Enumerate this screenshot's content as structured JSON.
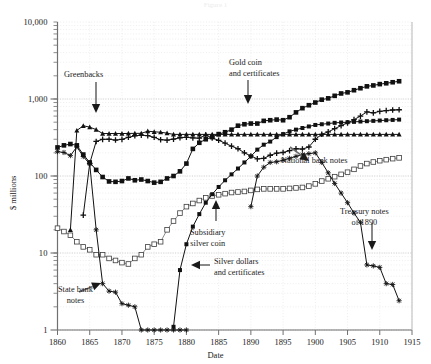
{
  "figure": {
    "faint_header": "Figure 1",
    "axis_title_y": "$ millions",
    "axis_title_x": "Date"
  },
  "annotations": [
    {
      "name": "greenbacks",
      "lines": [
        "Greenbacks"
      ]
    },
    {
      "name": "gold-coin",
      "lines": [
        "Gold coin",
        "and certificates"
      ]
    },
    {
      "name": "national-bank",
      "lines": [
        "National bank notes"
      ]
    },
    {
      "name": "subsidiary",
      "lines": [
        "Subsidiary",
        "silver coin"
      ]
    },
    {
      "name": "silver-dollars",
      "lines": [
        "Silver dollars",
        "and certificates"
      ]
    },
    {
      "name": "treasury-notes",
      "lines": [
        "Treasury notes",
        "of 1890"
      ]
    },
    {
      "name": "state-bank",
      "lines": [
        "State bank",
        "notes"
      ]
    }
  ],
  "chart_data": {
    "type": "line",
    "title": "",
    "xlabel": "Date",
    "ylabel": "$ millions",
    "xlim": [
      1860,
      1915
    ],
    "ylim": [
      1,
      10000
    ],
    "yscale": "log",
    "grid": true,
    "legend": "annotations-inline",
    "xticks": [
      1860,
      1865,
      1870,
      1875,
      1880,
      1885,
      1890,
      1895,
      1900,
      1905,
      1910,
      1915
    ],
    "yticks": [
      1,
      10,
      100,
      1000,
      10000
    ],
    "ytick_labels": [
      "1",
      "10",
      "100",
      "1,000",
      "10,000"
    ],
    "series": [
      {
        "name": "Greenbacks",
        "marker": "triangle-up",
        "color": "#111111",
        "points": [
          [
            1860,
            0
          ],
          [
            1862,
            20
          ],
          [
            1863,
            390
          ],
          [
            1864,
            449
          ],
          [
            1865,
            431
          ],
          [
            1866,
            400
          ],
          [
            1867,
            356
          ],
          [
            1868,
            356
          ],
          [
            1869,
            356
          ],
          [
            1870,
            356
          ],
          [
            1871,
            357
          ],
          [
            1872,
            358
          ],
          [
            1873,
            358
          ],
          [
            1874,
            382
          ],
          [
            1875,
            375
          ],
          [
            1876,
            370
          ],
          [
            1877,
            360
          ],
          [
            1878,
            347
          ],
          [
            1879,
            347
          ],
          [
            1880,
            347
          ],
          [
            1881,
            347
          ],
          [
            1882,
            347
          ],
          [
            1883,
            347
          ],
          [
            1884,
            347
          ],
          [
            1885,
            347
          ],
          [
            1886,
            347
          ],
          [
            1887,
            347
          ],
          [
            1888,
            347
          ],
          [
            1889,
            347
          ],
          [
            1890,
            347
          ],
          [
            1891,
            347
          ],
          [
            1892,
            347
          ],
          [
            1893,
            347
          ],
          [
            1894,
            347
          ],
          [
            1895,
            347
          ],
          [
            1896,
            347
          ],
          [
            1897,
            347
          ],
          [
            1898,
            347
          ],
          [
            1899,
            347
          ],
          [
            1900,
            347
          ],
          [
            1901,
            347
          ],
          [
            1902,
            347
          ],
          [
            1903,
            347
          ],
          [
            1904,
            347
          ],
          [
            1905,
            347
          ],
          [
            1906,
            347
          ],
          [
            1907,
            347
          ],
          [
            1908,
            347
          ],
          [
            1909,
            347
          ],
          [
            1910,
            347
          ],
          [
            1911,
            347
          ],
          [
            1912,
            347
          ],
          [
            1913,
            347
          ]
        ]
      },
      {
        "name": "Gold coin and certificates",
        "marker": "square-filled",
        "color": "#111111",
        "points": [
          [
            1860,
            235
          ],
          [
            1861,
            250
          ],
          [
            1862,
            260
          ],
          [
            1863,
            250
          ],
          [
            1864,
            190
          ],
          [
            1865,
            150
          ],
          [
            1866,
            120
          ],
          [
            1867,
            97
          ],
          [
            1868,
            85
          ],
          [
            1869,
            84
          ],
          [
            1870,
            86
          ],
          [
            1871,
            93
          ],
          [
            1872,
            88
          ],
          [
            1873,
            90
          ],
          [
            1874,
            86
          ],
          [
            1875,
            82
          ],
          [
            1876,
            84
          ],
          [
            1877,
            93
          ],
          [
            1878,
            100
          ],
          [
            1879,
            115
          ],
          [
            1880,
            145
          ],
          [
            1881,
            225
          ],
          [
            1882,
            270
          ],
          [
            1883,
            300
          ],
          [
            1884,
            320
          ],
          [
            1885,
            350
          ],
          [
            1886,
            370
          ],
          [
            1887,
            400
          ],
          [
            1888,
            450
          ],
          [
            1889,
            470
          ],
          [
            1890,
            480
          ],
          [
            1891,
            480
          ],
          [
            1892,
            520
          ],
          [
            1893,
            530
          ],
          [
            1894,
            540
          ],
          [
            1895,
            530
          ],
          [
            1896,
            580
          ],
          [
            1897,
            670
          ],
          [
            1898,
            760
          ],
          [
            1899,
            830
          ],
          [
            1900,
            900
          ],
          [
            1901,
            980
          ],
          [
            1902,
            1020
          ],
          [
            1903,
            1100
          ],
          [
            1904,
            1180
          ],
          [
            1905,
            1220
          ],
          [
            1906,
            1300
          ],
          [
            1907,
            1380
          ],
          [
            1908,
            1460
          ],
          [
            1909,
            1500
          ],
          [
            1910,
            1560
          ],
          [
            1911,
            1600
          ],
          [
            1912,
            1650
          ],
          [
            1913,
            1700
          ]
        ]
      },
      {
        "name": "National bank notes",
        "marker": "plus",
        "color": "#111111",
        "points": [
          [
            1863,
            0
          ],
          [
            1864,
            31
          ],
          [
            1865,
            146
          ],
          [
            1866,
            281
          ],
          [
            1867,
            299
          ],
          [
            1868,
            300
          ],
          [
            1869,
            293
          ],
          [
            1870,
            299
          ],
          [
            1871,
            318
          ],
          [
            1872,
            333
          ],
          [
            1873,
            339
          ],
          [
            1874,
            334
          ],
          [
            1875,
            318
          ],
          [
            1876,
            296
          ],
          [
            1877,
            292
          ],
          [
            1878,
            301
          ],
          [
            1879,
            314
          ],
          [
            1880,
            318
          ],
          [
            1881,
            312
          ],
          [
            1882,
            310
          ],
          [
            1883,
            340
          ],
          [
            1884,
            311
          ],
          [
            1885,
            291
          ],
          [
            1886,
            267
          ],
          [
            1887,
            244
          ],
          [
            1888,
            226
          ],
          [
            1889,
            200
          ],
          [
            1890,
            182
          ],
          [
            1891,
            167
          ],
          [
            1892,
            169
          ],
          [
            1893,
            186
          ],
          [
            1894,
            198
          ],
          [
            1895,
            202
          ],
          [
            1896,
            213
          ],
          [
            1897,
            226
          ],
          [
            1898,
            224
          ],
          [
            1899,
            238
          ],
          [
            1900,
            300
          ],
          [
            1901,
            348
          ],
          [
            1902,
            374
          ],
          [
            1903,
            412
          ],
          [
            1904,
            450
          ],
          [
            1905,
            490
          ],
          [
            1906,
            539
          ],
          [
            1907,
            600
          ],
          [
            1908,
            680
          ],
          [
            1909,
            660
          ],
          [
            1910,
            690
          ],
          [
            1911,
            708
          ],
          [
            1912,
            720
          ],
          [
            1913,
            725
          ]
        ]
      },
      {
        "name": "Subsidiary silver coin",
        "marker": "square-open",
        "color": "#4a4a4a",
        "points": [
          [
            1860,
            21
          ],
          [
            1861,
            19
          ],
          [
            1862,
            17
          ],
          [
            1863,
            14
          ],
          [
            1864,
            12
          ],
          [
            1865,
            11
          ],
          [
            1866,
            9.5
          ],
          [
            1867,
            9.5
          ],
          [
            1868,
            8.5
          ],
          [
            1869,
            8
          ],
          [
            1870,
            7.5
          ],
          [
            1871,
            7.2
          ],
          [
            1872,
            8.5
          ],
          [
            1873,
            9.5
          ],
          [
            1874,
            12
          ],
          [
            1875,
            13
          ],
          [
            1876,
            14
          ],
          [
            1877,
            20
          ],
          [
            1878,
            26
          ],
          [
            1879,
            33
          ],
          [
            1880,
            40
          ],
          [
            1881,
            44
          ],
          [
            1882,
            48
          ],
          [
            1883,
            52
          ],
          [
            1884,
            55
          ],
          [
            1885,
            57
          ],
          [
            1886,
            59
          ],
          [
            1887,
            61
          ],
          [
            1888,
            62
          ],
          [
            1889,
            63
          ],
          [
            1890,
            65
          ],
          [
            1891,
            67
          ],
          [
            1892,
            68
          ],
          [
            1893,
            68
          ],
          [
            1894,
            68
          ],
          [
            1895,
            68
          ],
          [
            1896,
            69
          ],
          [
            1897,
            70
          ],
          [
            1898,
            71
          ],
          [
            1899,
            74
          ],
          [
            1900,
            79
          ],
          [
            1901,
            86
          ],
          [
            1902,
            92
          ],
          [
            1903,
            98
          ],
          [
            1904,
            105
          ],
          [
            1905,
            112
          ],
          [
            1906,
            122
          ],
          [
            1907,
            135
          ],
          [
            1908,
            145
          ],
          [
            1909,
            152
          ],
          [
            1910,
            158
          ],
          [
            1911,
            163
          ],
          [
            1912,
            168
          ],
          [
            1913,
            172
          ]
        ]
      },
      {
        "name": "Silver dollars and certificates",
        "marker": "square-filled-small",
        "color": "#111111",
        "points": [
          [
            1878,
            1.1
          ],
          [
            1879,
            6
          ],
          [
            1880,
            13
          ],
          [
            1881,
            22
          ],
          [
            1882,
            32
          ],
          [
            1883,
            45
          ],
          [
            1884,
            58
          ],
          [
            1885,
            72
          ],
          [
            1886,
            88
          ],
          [
            1887,
            105
          ],
          [
            1888,
            125
          ],
          [
            1889,
            150
          ],
          [
            1890,
            180
          ],
          [
            1891,
            220
          ],
          [
            1892,
            255
          ],
          [
            1893,
            280
          ],
          [
            1894,
            320
          ],
          [
            1895,
            350
          ],
          [
            1896,
            380
          ],
          [
            1897,
            400
          ],
          [
            1898,
            420
          ],
          [
            1899,
            440
          ],
          [
            1900,
            460
          ],
          [
            1901,
            470
          ],
          [
            1902,
            480
          ],
          [
            1903,
            490
          ],
          [
            1904,
            495
          ],
          [
            1905,
            500
          ],
          [
            1906,
            505
          ],
          [
            1907,
            510
          ],
          [
            1908,
            515
          ],
          [
            1909,
            520
          ],
          [
            1910,
            525
          ],
          [
            1911,
            530
          ],
          [
            1912,
            535
          ],
          [
            1913,
            540
          ]
        ]
      },
      {
        "name": "State bank notes",
        "marker": "star",
        "color": "#111111",
        "points": [
          [
            1860,
            207
          ],
          [
            1861,
            202
          ],
          [
            1862,
            184
          ],
          [
            1863,
            239
          ],
          [
            1864,
            179
          ],
          [
            1865,
            143
          ],
          [
            1866,
            20
          ],
          [
            1867,
            4
          ],
          [
            1868,
            3.2
          ],
          [
            1869,
            3.1
          ],
          [
            1870,
            2.2
          ],
          [
            1871,
            2.1
          ],
          [
            1872,
            2.0
          ],
          [
            1873,
            1.0
          ],
          [
            1874,
            1.0
          ],
          [
            1875,
            1.0
          ],
          [
            1876,
            1.0
          ],
          [
            1877,
            1.0
          ],
          [
            1878,
            1.0
          ],
          [
            1879,
            1.0
          ],
          [
            1880,
            1.0
          ]
        ]
      },
      {
        "name": "Treasury notes of 1890",
        "marker": "star",
        "color": "#111111",
        "points": [
          [
            1890,
            40
          ],
          [
            1891,
            100
          ],
          [
            1892,
            130
          ],
          [
            1893,
            150
          ],
          [
            1894,
            153
          ],
          [
            1895,
            160
          ],
          [
            1896,
            170
          ],
          [
            1897,
            180
          ],
          [
            1898,
            190
          ],
          [
            1899,
            195
          ],
          [
            1900,
            200
          ],
          [
            1901,
            150
          ],
          [
            1902,
            110
          ],
          [
            1903,
            80
          ],
          [
            1904,
            60
          ],
          [
            1905,
            45
          ],
          [
            1906,
            33
          ],
          [
            1907,
            25
          ],
          [
            1908,
            7
          ],
          [
            1909,
            6.8
          ],
          [
            1910,
            6.5
          ],
          [
            1911,
            4.0
          ],
          [
            1912,
            3.9
          ],
          [
            1913,
            2.4
          ]
        ]
      }
    ]
  }
}
